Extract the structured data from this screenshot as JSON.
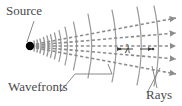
{
  "figure": {
    "background_color": "#ffffff",
    "width": 182,
    "height": 106
  },
  "labels": {
    "source": "Source",
    "wavefronts": "Wavefronts",
    "rays": "Rays",
    "wavelength_symbol": "λ"
  },
  "colors": {
    "source_dot": "#000000",
    "wavefront_stroke": "#9a9a9a",
    "ray_stroke": "#8c8c8c",
    "leader_stroke": "#8a8a8a",
    "text": "#4a4a4a"
  },
  "diagram": {
    "source_point": {
      "x": 30,
      "y": 46
    },
    "wavefront_count": 14,
    "ray_count": 5,
    "ray_style": "dashed",
    "ray_arrowheads": true,
    "wavefront_style": "solid-arc",
    "wavelength_annotation": {
      "symbol": "λ",
      "between": "adjacent wavefronts",
      "double_arrow": true
    },
    "leaders": [
      {
        "from": "source",
        "to": "source-dot"
      },
      {
        "from": "wavefronts",
        "to": "wavefront-arcs"
      },
      {
        "from": "rays",
        "to": "ray-lines"
      }
    ]
  }
}
